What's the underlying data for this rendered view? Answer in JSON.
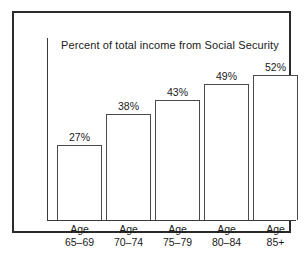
{
  "chart_data": {
    "type": "bar",
    "title": "Percent of total income from Social Security",
    "xlabel": "",
    "ylabel": "",
    "ylim": [
      0,
      60
    ],
    "grid": false,
    "legend": null,
    "categories": [
      "Age 65–69",
      "Age 70–74",
      "Age 75–79",
      "Age 80–84",
      "Age 85+"
    ],
    "category_lines": [
      [
        "Age",
        "65–69"
      ],
      [
        "Age",
        "70–74"
      ],
      [
        "Age",
        "75–79"
      ],
      [
        "Age",
        "80–84"
      ],
      [
        "Age",
        "85+"
      ]
    ],
    "values": [
      27,
      38,
      43,
      49,
      52
    ],
    "value_labels": [
      "27%",
      "38%",
      "43%",
      "49%",
      "52%"
    ]
  },
  "style": {
    "frame_color": "#2b2b2b",
    "axis_color": "#3a3a3a",
    "bar_border_color": "#4a4a4a",
    "bar_fill_color": "#ffffff",
    "background_color": "#ffffff",
    "text_color": "#1a1a1a"
  }
}
